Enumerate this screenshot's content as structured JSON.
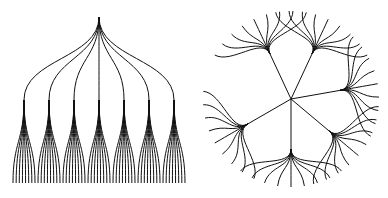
{
  "diagram": {
    "type": "tree-layouts",
    "stroke_color": "#111111",
    "background": "#ffffff",
    "tidy_tree": {
      "root": [
        99,
        17
      ],
      "children_count": 7,
      "children_x": [
        24,
        49,
        74,
        99,
        124,
        149,
        174
      ],
      "children_y": 100,
      "leaves_per_child": 8,
      "leaf_spread": 22,
      "leaf_y": 183
    },
    "radial_tree": {
      "center": [
        291,
        99
      ],
      "branch_count": 6,
      "branch_angles_deg": [
        -115,
        -65,
        -10,
        40,
        90,
        150
      ],
      "hub_radius": 50,
      "leaves_per_branch": 9,
      "leaf_radius": 88,
      "leaf_angle_spread_deg": 70
    }
  }
}
